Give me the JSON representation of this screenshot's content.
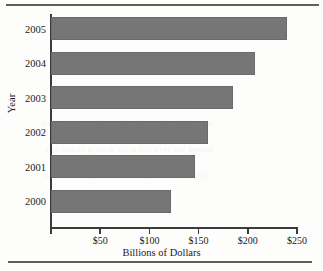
{
  "figure": {
    "kind": "horizontal-bar-chart",
    "background_color": "#fdfdfc",
    "bar_color": "#767676",
    "axis_color": "#3a3a3a",
    "rule_color": "#5e5e5e",
    "ghost_line_1": "the numbers and trends shown here illustrate",
    "ghost_line_2": "the steady growth recorded over the period",
    "ghost_line_3": "while the figures remain approximate only"
  },
  "chart_data": {
    "type": "bar",
    "orientation": "horizontal",
    "title": "",
    "subtitle": "",
    "xlabel": "Billions of Dollars",
    "ylabel": "Year",
    "categories": [
      "2005",
      "2004",
      "2003",
      "2002",
      "2001",
      "2000"
    ],
    "values": [
      240,
      207,
      185,
      160,
      146,
      122
    ],
    "series": [
      {
        "name": "Billions of Dollars",
        "values": [
          240,
          207,
          185,
          160,
          146,
          122
        ]
      }
    ],
    "xlim": [
      0,
      250
    ],
    "xticks": [
      0,
      50,
      100,
      150,
      200,
      250
    ],
    "xtick_labels": [
      "",
      "$50",
      "$100",
      "$150",
      "$200",
      "$250"
    ],
    "ytick_labels": [
      "2005",
      "2004",
      "2003",
      "2002",
      "2001",
      "2000"
    ],
    "grid": false,
    "legend": false,
    "legend_position": "none",
    "value_prefix": "$",
    "points": [
      {
        "category": "2005",
        "value": 240,
        "label": "$240"
      },
      {
        "category": "2004",
        "value": 207,
        "label": "$207"
      },
      {
        "category": "2003",
        "value": 185,
        "label": "$185"
      },
      {
        "category": "2002",
        "value": 160,
        "label": "$160"
      },
      {
        "category": "2001",
        "value": 146,
        "label": "$146"
      },
      {
        "category": "2000",
        "value": 122,
        "label": "$122"
      }
    ]
  }
}
